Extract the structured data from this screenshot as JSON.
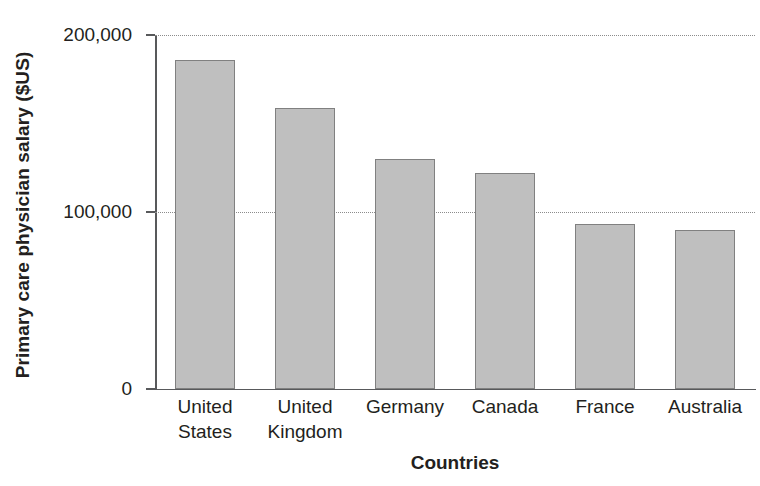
{
  "chart_data": {
    "type": "bar",
    "title": "",
    "subtitle": "",
    "xlabel": "Countries",
    "ylabel": "Primary care physician salary ($US)",
    "categories": [
      "United States",
      "United Kingdom",
      "Germany",
      "Canada",
      "France",
      "Australia"
    ],
    "category_lines": [
      [
        "United",
        "States"
      ],
      [
        "United",
        "Kingdom"
      ],
      [
        "Germany"
      ],
      [
        "Canada"
      ],
      [
        "France"
      ],
      [
        "Australia"
      ]
    ],
    "values": [
      186000,
      159000,
      130000,
      122000,
      93000,
      90000
    ],
    "ylim": [
      0,
      200000
    ],
    "yticks": [
      0,
      100000,
      200000
    ],
    "ytick_labels": [
      "0",
      "100,000",
      "200,000"
    ],
    "gridlines_y": [
      100000,
      200000
    ],
    "grid": true,
    "grid_style": "dotted",
    "legend": null,
    "legend_position": "none",
    "bar_color": "#bfbfbf",
    "bar_edge_color": "#808080",
    "axis_color": "#58595b",
    "grid_color": "#8c8c8c",
    "text_color": "#231f20",
    "background": "#ffffff"
  }
}
